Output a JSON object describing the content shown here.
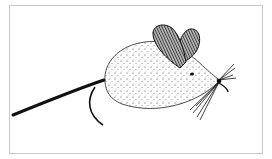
{
  "image": {
    "subject": "mouse-drawing",
    "style": "black ink stipple illustration",
    "colors": {
      "background": "#ffffff",
      "border": "#c8c8c8",
      "ink": "#111111",
      "ear": "#666666"
    }
  }
}
